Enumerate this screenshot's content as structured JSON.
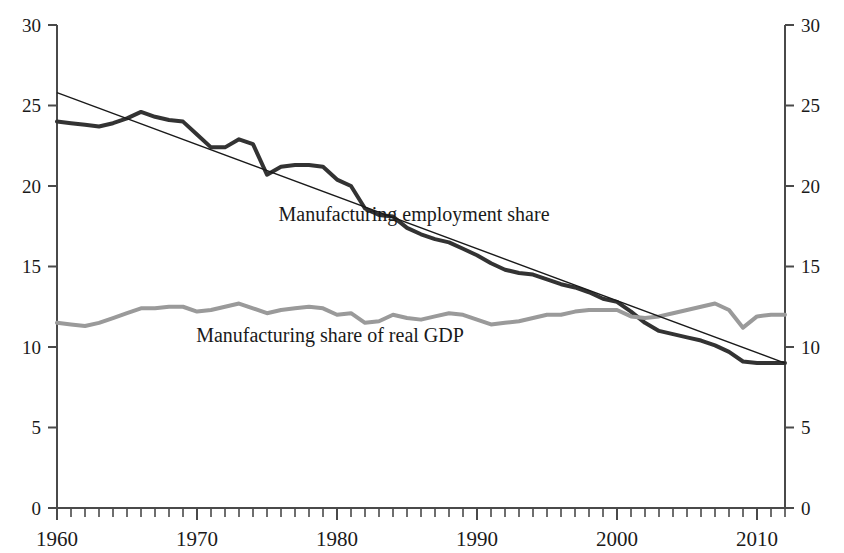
{
  "chart_data": {
    "type": "line",
    "title": "",
    "xlabel": "",
    "ylabel": "",
    "xlim": [
      1960,
      2012
    ],
    "ylim": [
      0,
      30
    ],
    "grid": false,
    "legend_position": "inline-annotations",
    "y_ticks": [
      0,
      5,
      10,
      15,
      20,
      25,
      30
    ],
    "y_tick_labels": [
      "0",
      "5",
      "10",
      "15",
      "20",
      "25",
      "30"
    ],
    "y_ticks_right": [
      0,
      5,
      10,
      15,
      20,
      25,
      30
    ],
    "y_tick_labels_right": [
      "0",
      "5",
      "10",
      "15",
      "20",
      "25",
      "30"
    ],
    "x_ticks_major": [
      1960,
      1970,
      1980,
      1990,
      2000,
      2010
    ],
    "x_tick_labels": [
      "1960",
      "1970",
      "1980",
      "1990",
      "2000",
      "2010"
    ],
    "x_minor_tick_interval": 1,
    "x": [
      1960,
      1961,
      1962,
      1963,
      1964,
      1965,
      1966,
      1967,
      1968,
      1969,
      1970,
      1971,
      1972,
      1973,
      1974,
      1975,
      1976,
      1977,
      1978,
      1979,
      1980,
      1981,
      1982,
      1983,
      1984,
      1985,
      1986,
      1987,
      1988,
      1989,
      1990,
      1991,
      1992,
      1993,
      1994,
      1995,
      1996,
      1997,
      1998,
      1999,
      2000,
      2001,
      2002,
      2003,
      2004,
      2005,
      2006,
      2007,
      2008,
      2009,
      2010,
      2011,
      2012
    ],
    "series": [
      {
        "name": "Manufacturing employment share",
        "color": "#333333",
        "width": 4,
        "label_x": 1985.5,
        "label_y": 17.8,
        "values": [
          24.0,
          23.9,
          23.8,
          23.7,
          23.9,
          24.2,
          24.6,
          24.3,
          24.1,
          24.0,
          23.2,
          22.4,
          22.4,
          22.9,
          22.6,
          20.7,
          21.2,
          21.3,
          21.3,
          21.2,
          20.4,
          20.0,
          18.6,
          18.2,
          18.1,
          17.4,
          17.0,
          16.7,
          16.5,
          16.1,
          15.7,
          15.2,
          14.8,
          14.6,
          14.5,
          14.2,
          13.9,
          13.7,
          13.4,
          13.0,
          12.8,
          12.2,
          11.5,
          11.0,
          10.8,
          10.6,
          10.4,
          10.1,
          9.7,
          9.1,
          9.0,
          9.0,
          9.0
        ]
      },
      {
        "name": "Manufacturing share of real GDP",
        "color": "#9a9a9a",
        "width": 4,
        "label_x": 1979.5,
        "label_y": 10.3,
        "values": [
          11.5,
          11.4,
          11.3,
          11.5,
          11.8,
          12.1,
          12.4,
          12.4,
          12.5,
          12.5,
          12.2,
          12.3,
          12.5,
          12.7,
          12.4,
          12.1,
          12.3,
          12.4,
          12.5,
          12.4,
          12.0,
          12.1,
          11.5,
          11.6,
          12.0,
          11.8,
          11.7,
          11.9,
          12.1,
          12.0,
          11.7,
          11.4,
          11.5,
          11.6,
          11.8,
          12.0,
          12.0,
          12.2,
          12.3,
          12.3,
          12.3,
          11.9,
          11.8,
          11.9,
          12.1,
          12.3,
          12.5,
          12.7,
          12.3,
          11.2,
          11.9,
          12.0,
          12.0
        ]
      }
    ],
    "trend_line": {
      "name": "linear trend of manufacturing employment share",
      "color": "#1a1a1a",
      "width": 1.4,
      "x_start": 1960,
      "y_start": 25.8,
      "x_end": 2012,
      "y_end": 9.0
    }
  },
  "annotations": {
    "employment_label": "Manufacturing employment share",
    "gdp_label": "Manufacturing share of real GDP"
  }
}
